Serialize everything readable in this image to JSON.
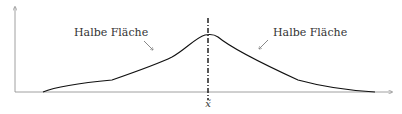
{
  "diagram": {
    "left_label": "Halbe Fläche",
    "right_label": "Halbe Fläche",
    "median_label": "x̃",
    "colors": {
      "axis": "#888888",
      "curve": "#111111",
      "median_line": "#111111",
      "text": "#333333"
    }
  }
}
